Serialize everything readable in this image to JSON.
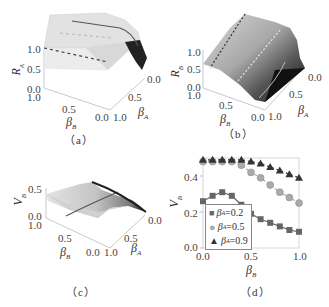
{
  "panels": {
    "a": {
      "caption": "（a）",
      "zlabel": "R",
      "zlabel_sub": "A",
      "ylabel": "β",
      "ylabel_sub": "B",
      "xlabel": "β",
      "xlabel_sub": "A",
      "z_ticks": [
        "1.0",
        "0.5",
        "0.0"
      ],
      "y_ticks": [
        "1.0",
        "0.5",
        "0.0"
      ],
      "x_ticks": [
        "0.0",
        "0.5",
        "1.0"
      ]
    },
    "b": {
      "caption": "（b）",
      "zlabel": "R",
      "zlabel_sub": "B",
      "ylabel": "β",
      "ylabel_sub": "B",
      "xlabel": "β",
      "xlabel_sub": "A",
      "z_ticks": [
        "1.0",
        "0.5",
        "0.0"
      ],
      "y_ticks": [
        "1.0",
        "0.5",
        "0.0"
      ],
      "x_ticks": [
        "0.0",
        "0.5",
        "1.0"
      ]
    },
    "c": {
      "caption": "（c）",
      "zlabel": "V",
      "zlabel_sub": "B",
      "ylabel": "β",
      "ylabel_sub": "B",
      "xlabel": "β",
      "xlabel_sub": "A",
      "z_ticks": [
        "0.5",
        "0.0"
      ],
      "y_ticks": [
        "1.0",
        "0.5",
        "0.0"
      ],
      "x_ticks": [
        "0.0",
        "0.5",
        "1.0"
      ]
    },
    "d": {
      "caption": "（d）",
      "ylabel": "V",
      "ylabel_sub": "B",
      "xlabel": "β",
      "xlabel_sub": "B",
      "y_ticks": [
        "0.4",
        "0.2",
        "0.0"
      ],
      "x_ticks": [
        "0.0",
        "0.5",
        "1.0"
      ],
      "legend": [
        {
          "symbol": "■",
          "label_pre": "β",
          "label_sub": "A",
          "label_post": "=0.2",
          "color": "#666666"
        },
        {
          "symbol": "●",
          "label_pre": "β",
          "label_sub": "A",
          "label_post": "=0.5",
          "color": "#aaaaaa"
        },
        {
          "symbol": "▲",
          "label_pre": "β",
          "label_sub": "A",
          "label_post": "=0.9",
          "color": "#333333"
        }
      ]
    }
  },
  "chart_data": [
    {
      "id": "a",
      "type": "surface3d",
      "title": "(a)",
      "xlabel": "β_A",
      "ylabel": "β_B",
      "zlabel": "R_A",
      "xlim": [
        0,
        1
      ],
      "ylim": [
        0,
        1
      ],
      "zlim": [
        0,
        1
      ],
      "description": "Surface near R_A≈1 across most of domain, dropping sharply to 0 near β_A→0 edge"
    },
    {
      "id": "b",
      "type": "surface3d",
      "title": "(b)",
      "xlabel": "β_A",
      "ylabel": "β_B",
      "zlabel": "R_B",
      "xlim": [
        0,
        1
      ],
      "ylim": [
        0,
        1
      ],
      "zlim": [
        0,
        1
      ],
      "description": "Surface rising from ~0 at low β_B to ~1 at high β_B, grayscale shading"
    },
    {
      "id": "c",
      "type": "surface3d",
      "title": "(c)",
      "xlabel": "β_A",
      "ylabel": "β_B",
      "zlabel": "V_B",
      "xlim": [
        0,
        1
      ],
      "ylim": [
        0,
        1
      ],
      "zlim": [
        0,
        0.5
      ],
      "description": "Surface around V_B≈0.3–0.5, decreasing toward β_A→0 edge"
    },
    {
      "id": "d",
      "type": "line",
      "title": "(d)",
      "xlabel": "β_B",
      "ylabel": "V_B",
      "xlim": [
        0,
        1
      ],
      "ylim": [
        0,
        0.5
      ],
      "x": [
        0.0,
        0.1,
        0.2,
        0.3,
        0.4,
        0.5,
        0.6,
        0.7,
        0.8,
        0.9,
        1.0
      ],
      "series": [
        {
          "name": "β_A=0.2",
          "marker": "square",
          "values": [
            0.26,
            0.29,
            0.31,
            0.29,
            0.24,
            0.19,
            0.16,
            0.14,
            0.12,
            0.1,
            0.09
          ]
        },
        {
          "name": "β_A=0.5",
          "marker": "circle",
          "values": [
            0.48,
            0.48,
            0.48,
            0.48,
            0.46,
            0.42,
            0.39,
            0.35,
            0.31,
            0.28,
            0.25
          ]
        },
        {
          "name": "β_A=0.9",
          "marker": "triangle",
          "values": [
            0.49,
            0.49,
            0.49,
            0.49,
            0.49,
            0.48,
            0.47,
            0.45,
            0.43,
            0.41,
            0.39
          ]
        }
      ],
      "legend_position": "lower-left",
      "grid": false
    }
  ]
}
